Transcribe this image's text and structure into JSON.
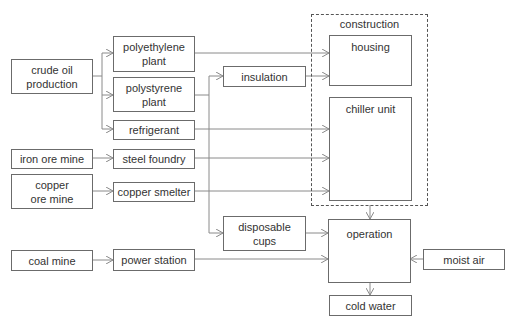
{
  "diagram": {
    "type": "flowchart",
    "nodes": {
      "crude_oil": "crude oil production",
      "polyethylene": "polyethylene plant",
      "polystyrene": "polystyrene plant",
      "refrigerant": "refrigerant",
      "iron_ore": "iron ore mine",
      "steel_foundry": "steel foundry",
      "copper_ore": "copper ore mine",
      "copper_smelter": "copper smelter",
      "coal_mine": "coal mine",
      "power_station": "power station",
      "insulation": "insulation",
      "disposable_cups": "disposable cups",
      "housing": "housing",
      "chiller_unit": "chiller unit",
      "operation": "operation",
      "moist_air": "moist air",
      "cold_water": "cold water"
    },
    "groups": {
      "construction": "construction"
    },
    "edges": [
      {
        "from": "crude oil production",
        "to": "polyethylene plant"
      },
      {
        "from": "crude oil production",
        "to": "polystyrene plant"
      },
      {
        "from": "crude oil production",
        "to": "refrigerant"
      },
      {
        "from": "polyethylene plant",
        "to": "housing"
      },
      {
        "from": "polystyrene plant",
        "to": "insulation"
      },
      {
        "from": "polystyrene plant",
        "to": "disposable cups"
      },
      {
        "from": "insulation",
        "to": "housing"
      },
      {
        "from": "refrigerant",
        "to": "chiller unit"
      },
      {
        "from": "iron ore mine",
        "to": "steel foundry"
      },
      {
        "from": "steel foundry",
        "to": "chiller unit"
      },
      {
        "from": "copper ore mine",
        "to": "copper smelter"
      },
      {
        "from": "copper smelter",
        "to": "chiller unit"
      },
      {
        "from": "construction",
        "to": "operation"
      },
      {
        "from": "disposable cups",
        "to": "operation"
      },
      {
        "from": "coal mine",
        "to": "power station"
      },
      {
        "from": "power station",
        "to": "operation"
      },
      {
        "from": "moist air",
        "to": "operation"
      },
      {
        "from": "operation",
        "to": "cold water"
      }
    ],
    "colors": {
      "stroke": "#6b6b6b",
      "arrow": "#888888",
      "text": "#333333"
    }
  }
}
